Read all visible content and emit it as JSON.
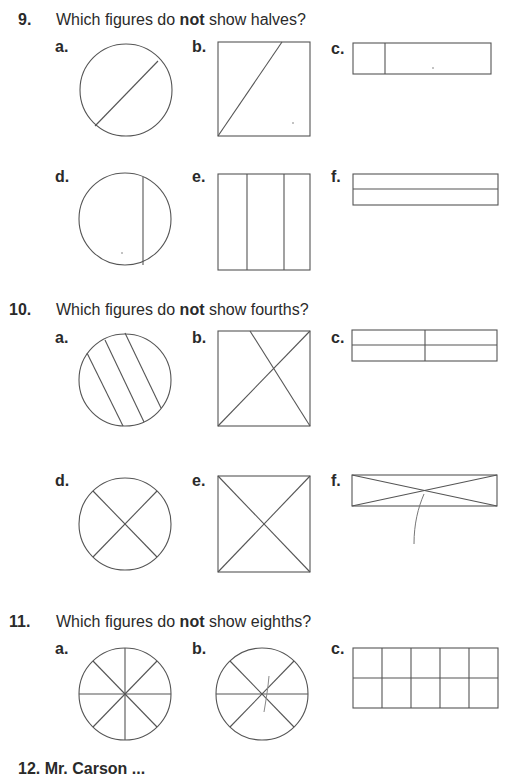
{
  "questions": [
    {
      "number": "9.",
      "prompt_before": "Which figures do ",
      "prompt_bold": "not",
      "prompt_after": " show halves?",
      "figures": [
        {
          "label": "a.",
          "shape": "circle",
          "description": "circle with one diagonal chord off-center"
        },
        {
          "label": "b.",
          "shape": "square",
          "description": "square cut by slanted line from bottom-left to top"
        },
        {
          "label": "c.",
          "shape": "rectangle",
          "description": "rectangle with one vertical line near left"
        },
        {
          "label": "d.",
          "shape": "circle",
          "description": "circle with vertical chord right of center"
        },
        {
          "label": "e.",
          "shape": "square",
          "description": "square with two vertical lines (thirds)"
        },
        {
          "label": "f.",
          "shape": "rectangle",
          "description": "rectangle split horizontally in half"
        }
      ]
    },
    {
      "number": "10.",
      "prompt_before": "Which figures do ",
      "prompt_bold": "not",
      "prompt_after": " show fourths?",
      "figures": [
        {
          "label": "a.",
          "shape": "circle",
          "description": "circle with three parallel diagonal chords"
        },
        {
          "label": "b.",
          "shape": "square",
          "description": "square with one diagonal and one off-corner line"
        },
        {
          "label": "c.",
          "shape": "rectangle",
          "description": "rectangle divided into 4 equal parts"
        },
        {
          "label": "d.",
          "shape": "circle",
          "description": "circle with two perpendicular diameters"
        },
        {
          "label": "e.",
          "shape": "square",
          "description": "square with both diagonals"
        },
        {
          "label": "f.",
          "shape": "rectangle",
          "description": "long rectangle with both diagonals and pencil mark"
        }
      ]
    },
    {
      "number": "11.",
      "prompt_before": "Which figures do ",
      "prompt_bold": "not",
      "prompt_after": " show eighths?",
      "figures": [
        {
          "label": "a.",
          "shape": "circle",
          "description": "circle with 8 equal sectors"
        },
        {
          "label": "b.",
          "shape": "circle",
          "description": "circle with 6 sectors and pencil mark"
        },
        {
          "label": "c.",
          "shape": "rectangle",
          "description": "rectangle grid 5 columns by 2 rows"
        }
      ]
    }
  ],
  "next_question_partial": "12.    Mr. Carson ..."
}
